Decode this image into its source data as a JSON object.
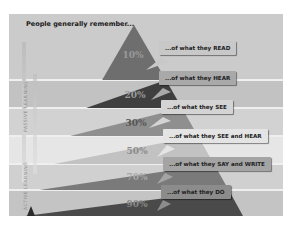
{
  "title": "People generally remember...",
  "side_labels": {
    "top": "PASSIVE LEARNING",
    "bottom": "ACTIVE LEARNING"
  },
  "levels": [
    {
      "percent": "10%",
      "label": "...of what they READ",
      "band_color": "#6e6e6e",
      "callout_color": "#c8c8c8"
    },
    {
      "percent": "20%",
      "label": "...of what they HEAR",
      "band_color": "#3f3f3f",
      "callout_color": "#a9a9a9"
    },
    {
      "percent": "30%",
      "label": "...of what they SEE",
      "band_color": "#8f8f8f",
      "callout_color": "#d4d4d4"
    },
    {
      "percent": "50%",
      "label": "...of what they SEE and HEAR",
      "band_color": "#c2c2c2",
      "callout_color": "#e4e4e4"
    },
    {
      "percent": "70%",
      "label": "...of what they SAY and WRITE",
      "band_color": "#7a7a7a",
      "callout_color": "#a4a4a4"
    },
    {
      "percent": "90%",
      "label": "...of what they DO",
      "band_color": "#4a4a4a",
      "callout_color": "#8c8c8c"
    }
  ],
  "colors": {
    "panel_bg": "#c9c9c9",
    "stripe_light": "#d6d6d6",
    "stripe_dark": "#bdbdbd"
  }
}
